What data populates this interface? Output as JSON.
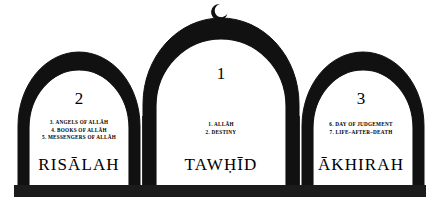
{
  "diagram": {
    "colors": {
      "ink": "#1a1a1a",
      "background": "#ffffff",
      "outline": "#000000"
    },
    "finial": {
      "icon": "crescent-moon-icon",
      "label": "Crescent moon finial"
    },
    "base": {
      "label": "Foundation bar"
    },
    "pillars": [
      {
        "id": "tawhid",
        "number": "1",
        "title": "TAWḤĪD",
        "items": [
          "1. ALLĀH",
          "2. DESTINY"
        ]
      },
      {
        "id": "risalah",
        "number": "2",
        "title": "RISĀLAH",
        "items": [
          "3. ANGELS OF ALLĀH",
          "4. BOOKS OF ALLĀH",
          "5. MESSENGERS OF ALLĀH"
        ]
      },
      {
        "id": "akhirah",
        "number": "3",
        "title": "ĀKHIRAH",
        "items": [
          "6. DAY OF JUDGEMENT",
          "7. LIFE–AFTER–DEATH"
        ]
      }
    ]
  }
}
